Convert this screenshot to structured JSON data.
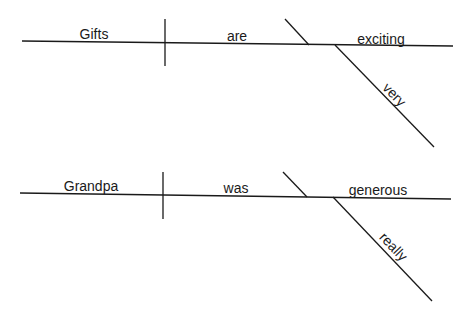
{
  "diagrams": [
    {
      "sentence": "Gifts are very exciting",
      "subject": "Gifts",
      "verb": "are",
      "predicate_adjective": "exciting",
      "modifier": "very"
    },
    {
      "sentence": "Grandpa was really generous",
      "subject": "Grandpa",
      "verb": "was",
      "predicate_adjective": "generous",
      "modifier": "really"
    }
  ],
  "colors": {
    "line": "#1a1a1a",
    "background": "#ffffff"
  }
}
